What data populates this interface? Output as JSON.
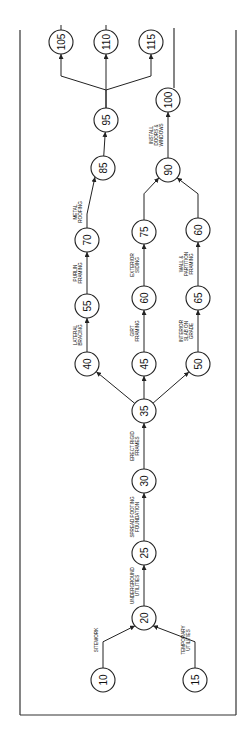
{
  "diagram": {
    "type": "activity-on-arrow network (rotated 90° counter-clockwise)",
    "nodes": [
      {
        "id": "10",
        "label": "10",
        "x": 103,
        "y": 680
      },
      {
        "id": "15",
        "label": "15",
        "x": 195,
        "y": 680
      },
      {
        "id": "20",
        "label": "20",
        "x": 144,
        "y": 618
      },
      {
        "id": "25",
        "label": "25",
        "x": 144,
        "y": 553
      },
      {
        "id": "30",
        "label": "30",
        "x": 144,
        "y": 481
      },
      {
        "id": "35",
        "label": "35",
        "x": 144,
        "y": 411
      },
      {
        "id": "40",
        "label": "40",
        "x": 87,
        "y": 364
      },
      {
        "id": "55",
        "label": "55",
        "x": 87,
        "y": 306
      },
      {
        "id": "70",
        "label": "70",
        "x": 87,
        "y": 240
      },
      {
        "id": "45",
        "label": "45",
        "x": 144,
        "y": 364
      },
      {
        "id": "60a",
        "label": "60",
        "x": 144,
        "y": 298
      },
      {
        "id": "75",
        "label": "75",
        "x": 144,
        "y": 232
      },
      {
        "id": "50",
        "label": "50",
        "x": 198,
        "y": 364
      },
      {
        "id": "65",
        "label": "65",
        "x": 198,
        "y": 298
      },
      {
        "id": "60b",
        "label": "60",
        "x": 198,
        "y": 230
      },
      {
        "id": "85",
        "label": "85",
        "x": 103,
        "y": 168
      },
      {
        "id": "95",
        "label": "95",
        "x": 106,
        "y": 120
      },
      {
        "id": "90",
        "label": "90",
        "x": 168,
        "y": 170
      },
      {
        "id": "100",
        "label": "100",
        "x": 168,
        "y": 100
      },
      {
        "id": "105",
        "label": "105",
        "x": 61,
        "y": 42
      },
      {
        "id": "110",
        "label": "110",
        "x": 106,
        "y": 42
      },
      {
        "id": "115",
        "label": "115",
        "x": 151,
        "y": 42
      }
    ],
    "activities": [
      {
        "from": "10",
        "to": "20",
        "label": [
          "SITEWORK"
        ]
      },
      {
        "from": "15",
        "to": "20",
        "label": [
          "TEMPORARY",
          "UTILITIES"
        ]
      },
      {
        "from": "20",
        "to": "25",
        "label": [
          "UNDERGROUND",
          "UTILITIES"
        ]
      },
      {
        "from": "25",
        "to": "30",
        "label": [
          "SPREAD FOOTING",
          "FOUNDATION"
        ]
      },
      {
        "from": "30",
        "to": "35",
        "label": [
          "ERECT RIGID",
          "FRAMES"
        ]
      },
      {
        "from": "35",
        "to": "40",
        "label": []
      },
      {
        "from": "35",
        "to": "45",
        "label": []
      },
      {
        "from": "35",
        "to": "50",
        "label": []
      },
      {
        "from": "40",
        "to": "55",
        "label": [
          "LATERAL",
          "BRACING"
        ]
      },
      {
        "from": "55",
        "to": "70",
        "label": [
          "PURLIN",
          "FRAMING"
        ]
      },
      {
        "from": "70",
        "to": "85",
        "label": [
          "METAL",
          "ROOFING"
        ]
      },
      {
        "from": "45",
        "to": "60a",
        "label": [
          "GIRT",
          "FRAMING"
        ]
      },
      {
        "from": "60a",
        "to": "75",
        "label": [
          "EXTERIOR",
          "SIDING"
        ]
      },
      {
        "from": "50",
        "to": "65",
        "label": [
          "INTERIOR",
          "SLAB ON",
          "GRADE"
        ]
      },
      {
        "from": "65",
        "to": "60b",
        "label": [
          "WALL &",
          "PARTITION",
          "FRAMING"
        ]
      },
      {
        "from": "75",
        "to": "90",
        "label": []
      },
      {
        "from": "60b",
        "to": "90",
        "label": []
      },
      {
        "from": "85",
        "to": "95",
        "label": []
      },
      {
        "from": "90",
        "to": "100",
        "label": [
          "INSTALL",
          "DOORS &",
          "WINDOWS"
        ]
      },
      {
        "from": "95",
        "to": "105",
        "label": []
      },
      {
        "from": "95",
        "to": "110",
        "label": []
      },
      {
        "from": "95",
        "to": "115",
        "label": []
      }
    ]
  }
}
